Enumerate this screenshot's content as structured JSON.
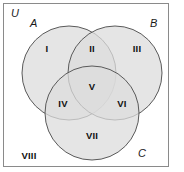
{
  "figure": {
    "universe_label": "U",
    "sets": [
      {
        "id": "A",
        "label": "A",
        "cx": 69,
        "cy": 73,
        "r": 47
      },
      {
        "id": "B",
        "label": "B",
        "cx": 115,
        "cy": 73,
        "r": 47
      },
      {
        "id": "C",
        "label": "C",
        "cx": 92,
        "cy": 113,
        "r": 47
      }
    ],
    "regions": [
      {
        "id": "I",
        "label": "I",
        "x": 47,
        "y": 49,
        "meaning": "A only"
      },
      {
        "id": "II",
        "label": "II",
        "x": 92,
        "y": 49,
        "meaning": "A and B only"
      },
      {
        "id": "III",
        "label": "III",
        "x": 137,
        "y": 49,
        "meaning": "B only"
      },
      {
        "id": "IV",
        "label": "IV",
        "x": 63,
        "y": 104,
        "meaning": "A and C only"
      },
      {
        "id": "V",
        "label": "V",
        "x": 92,
        "y": 87,
        "meaning": "A and B and C"
      },
      {
        "id": "VI",
        "label": "VI",
        "x": 122,
        "y": 104,
        "meaning": "B and C only"
      },
      {
        "id": "VII",
        "label": "VII",
        "x": 92,
        "y": 136,
        "meaning": "C only"
      },
      {
        "id": "VIII",
        "label": "VIII",
        "x": 29,
        "y": 156,
        "meaning": "outside all sets"
      }
    ],
    "colors": {
      "circle_fill": "#dcdcdc",
      "circle_stroke": "#5a5a5a",
      "frame_stroke": "#8a8a8a",
      "background": "#ffffff",
      "text": "#111111"
    }
  }
}
